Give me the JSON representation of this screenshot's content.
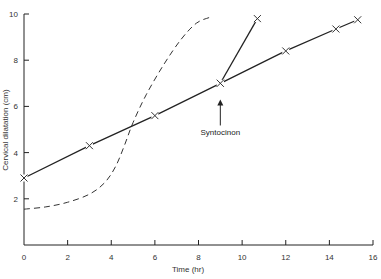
{
  "chart_data": {
    "type": "line",
    "title": "",
    "xlabel": "Time (hr)",
    "ylabel": "Cervical dilatation (cm)",
    "xlim": [
      0,
      16
    ],
    "ylim": [
      0,
      10
    ],
    "xticks": [
      0,
      2,
      4,
      6,
      8,
      10,
      12,
      14,
      16
    ],
    "yticks": [
      2,
      4,
      6,
      8,
      10
    ],
    "grid": false,
    "legend": null,
    "series": [
      {
        "name": "Partogram (actual progress)",
        "style": "solid-with-x-markers",
        "x": [
          0,
          3,
          6,
          9,
          12,
          14.3,
          15.3
        ],
        "y": [
          2.9,
          4.3,
          5.6,
          7.0,
          8.4,
          9.35,
          9.75
        ]
      },
      {
        "name": "Augmented progress after Syntocinon",
        "style": "solid-with-x-markers",
        "x": [
          9,
          10.7
        ],
        "y": [
          7.0,
          9.8
        ]
      },
      {
        "name": "Normal labour curve",
        "style": "dashed",
        "x": [
          0,
          1,
          2,
          3,
          3.7,
          4.2,
          4.6,
          5.0,
          5.6,
          6.4,
          7.2,
          7.9,
          8.5
        ],
        "y": [
          1.55,
          1.65,
          1.85,
          2.2,
          2.7,
          3.4,
          4.3,
          5.3,
          6.5,
          7.8,
          8.9,
          9.6,
          9.85
        ]
      }
    ],
    "annotations": [
      {
        "text": "Syntocinon",
        "x": 9,
        "y": 4.3,
        "arrow": "up",
        "arrow_tip": [
          9,
          6.3
        ]
      }
    ]
  },
  "labels": {
    "xlabel": "Time (hr)",
    "ylabel": "Cervical dilatation (cm)",
    "annotation": "Syntocinon",
    "xticks": [
      "0",
      "2",
      "4",
      "6",
      "8",
      "10",
      "12",
      "14",
      "16"
    ],
    "yticks": [
      "2",
      "4",
      "6",
      "8",
      "10"
    ]
  }
}
